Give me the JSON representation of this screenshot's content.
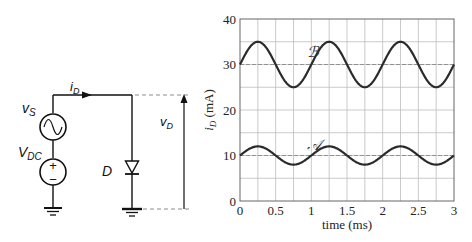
{
  "circuit": {
    "current_label": "i",
    "current_sub": "D",
    "source_ac_label": "v",
    "source_ac_sub": "S",
    "source_dc_label": "V",
    "source_dc_sub": "DC",
    "diode_label": "D",
    "voltage_label": "v",
    "voltage_sub": "D",
    "plus_sign": "+",
    "minus_sign": "−"
  },
  "chart_data": {
    "type": "line",
    "title": "",
    "xlabel": "time (ms)",
    "ylabel": "i_D (mA)",
    "ylabel_main": "i",
    "ylabel_sub": "D",
    "ylabel_unit": " (mA)",
    "xlim": [
      0,
      3
    ],
    "ylim": [
      0,
      40
    ],
    "xticks": [
      "0",
      "0.5",
      "1",
      "1.5",
      "2",
      "2.5",
      "3"
    ],
    "yticks": [
      "0",
      "10",
      "20",
      "30",
      "40"
    ],
    "grid": true,
    "grid_x_step": 0.25,
    "grid_y_step": 5,
    "reference_lines": [
      10,
      30
    ],
    "series": [
      {
        "name": "𝒜",
        "description": "i_D = 10 + 2 sin(2π t) mA",
        "dc": 10,
        "amplitude": 2,
        "period_ms": 1,
        "x": [
          0,
          0.25,
          0.5,
          0.75,
          1,
          1.25,
          1.5,
          1.75,
          2,
          2.25,
          2.5,
          2.75,
          3
        ],
        "y": [
          10,
          12,
          10,
          8,
          10,
          12,
          10,
          8,
          10,
          12,
          10,
          8,
          10
        ]
      },
      {
        "name": "ℬ",
        "description": "i_D = 30 + 5 sin(2π t) mA",
        "dc": 30,
        "amplitude": 5,
        "period_ms": 1,
        "x": [
          0,
          0.25,
          0.5,
          0.75,
          1,
          1.25,
          1.5,
          1.75,
          2,
          2.25,
          2.5,
          2.75,
          3
        ],
        "y": [
          30,
          35,
          30,
          25,
          30,
          35,
          30,
          25,
          30,
          35,
          30,
          25,
          30
        ]
      }
    ],
    "annotations": [
      {
        "text": "ℬ",
        "x": 1.0,
        "y": 33
      },
      {
        "text": "𝒜",
        "x": 1.0,
        "y": 12.5
      }
    ]
  }
}
